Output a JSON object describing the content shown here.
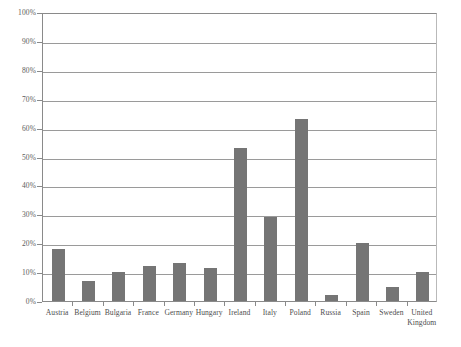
{
  "chart_data": {
    "type": "bar",
    "title": "",
    "subtitle": "",
    "xlabel": "",
    "ylabel": "",
    "ylim": [
      0,
      100
    ],
    "grid": true,
    "legend": null,
    "legend_position": "none",
    "y_tick_labels": [
      "100%",
      "90%",
      "80%",
      "70%",
      "60%",
      "50%",
      "40%",
      "30%",
      "20%",
      "10%",
      "0%"
    ],
    "y_tick_values": [
      100,
      90,
      80,
      70,
      60,
      50,
      40,
      30,
      20,
      10,
      0
    ],
    "categories": [
      "Austria",
      "Belgium",
      "Bulgaria",
      "France",
      "Germany",
      "Hungary",
      "Ireland",
      "Italy",
      "Poland",
      "Russia",
      "Spain",
      "Sweden",
      "United Kingdom"
    ],
    "values": [
      18,
      7,
      10,
      12,
      13,
      11.5,
      53,
      29,
      63,
      2,
      20,
      5,
      10
    ],
    "bar_color": "#757575",
    "axis_color": "#8a8a8a",
    "gridline_color": "#9a9a9a",
    "background_color": "#ffffff"
  },
  "caption": {
    "text": ""
  }
}
